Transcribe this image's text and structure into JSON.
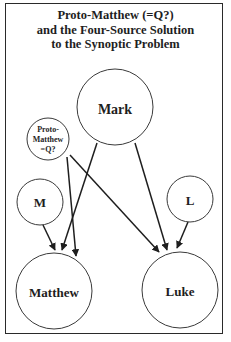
{
  "title": {
    "lines": [
      "Proto-Matthew (=Q?)",
      "and the Four-Source Solution",
      "to the Synoptic Problem"
    ]
  },
  "nodes": {
    "mark": {
      "label": "Mark"
    },
    "proto_matthew": {
      "label_lines": [
        "Proto-",
        "Matthew",
        "=Q?"
      ]
    },
    "m": {
      "label": "M"
    },
    "l": {
      "label": "L"
    },
    "matthew": {
      "label": "Matthew"
    },
    "luke": {
      "label": "Luke"
    }
  },
  "edges": [
    {
      "from": "mark",
      "to": "matthew"
    },
    {
      "from": "mark",
      "to": "luke"
    },
    {
      "from": "proto_matthew",
      "to": "matthew"
    },
    {
      "from": "proto_matthew",
      "to": "luke"
    },
    {
      "from": "m",
      "to": "matthew"
    },
    {
      "from": "l",
      "to": "luke"
    }
  ]
}
